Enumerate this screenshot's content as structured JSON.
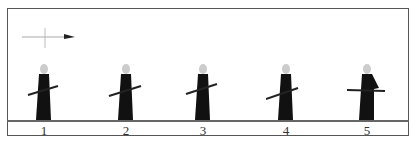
{
  "diagram": {
    "direction_indicator": "arrow pointing right",
    "figures": [
      {
        "label": "1",
        "x": 44
      },
      {
        "label": "2",
        "x": 126
      },
      {
        "label": "3",
        "x": 203
      },
      {
        "label": "4",
        "x": 286
      },
      {
        "label": "5",
        "x": 367
      }
    ],
    "colors": {
      "robe": "#111111",
      "head": "#cccccc",
      "line": "#555555"
    }
  }
}
